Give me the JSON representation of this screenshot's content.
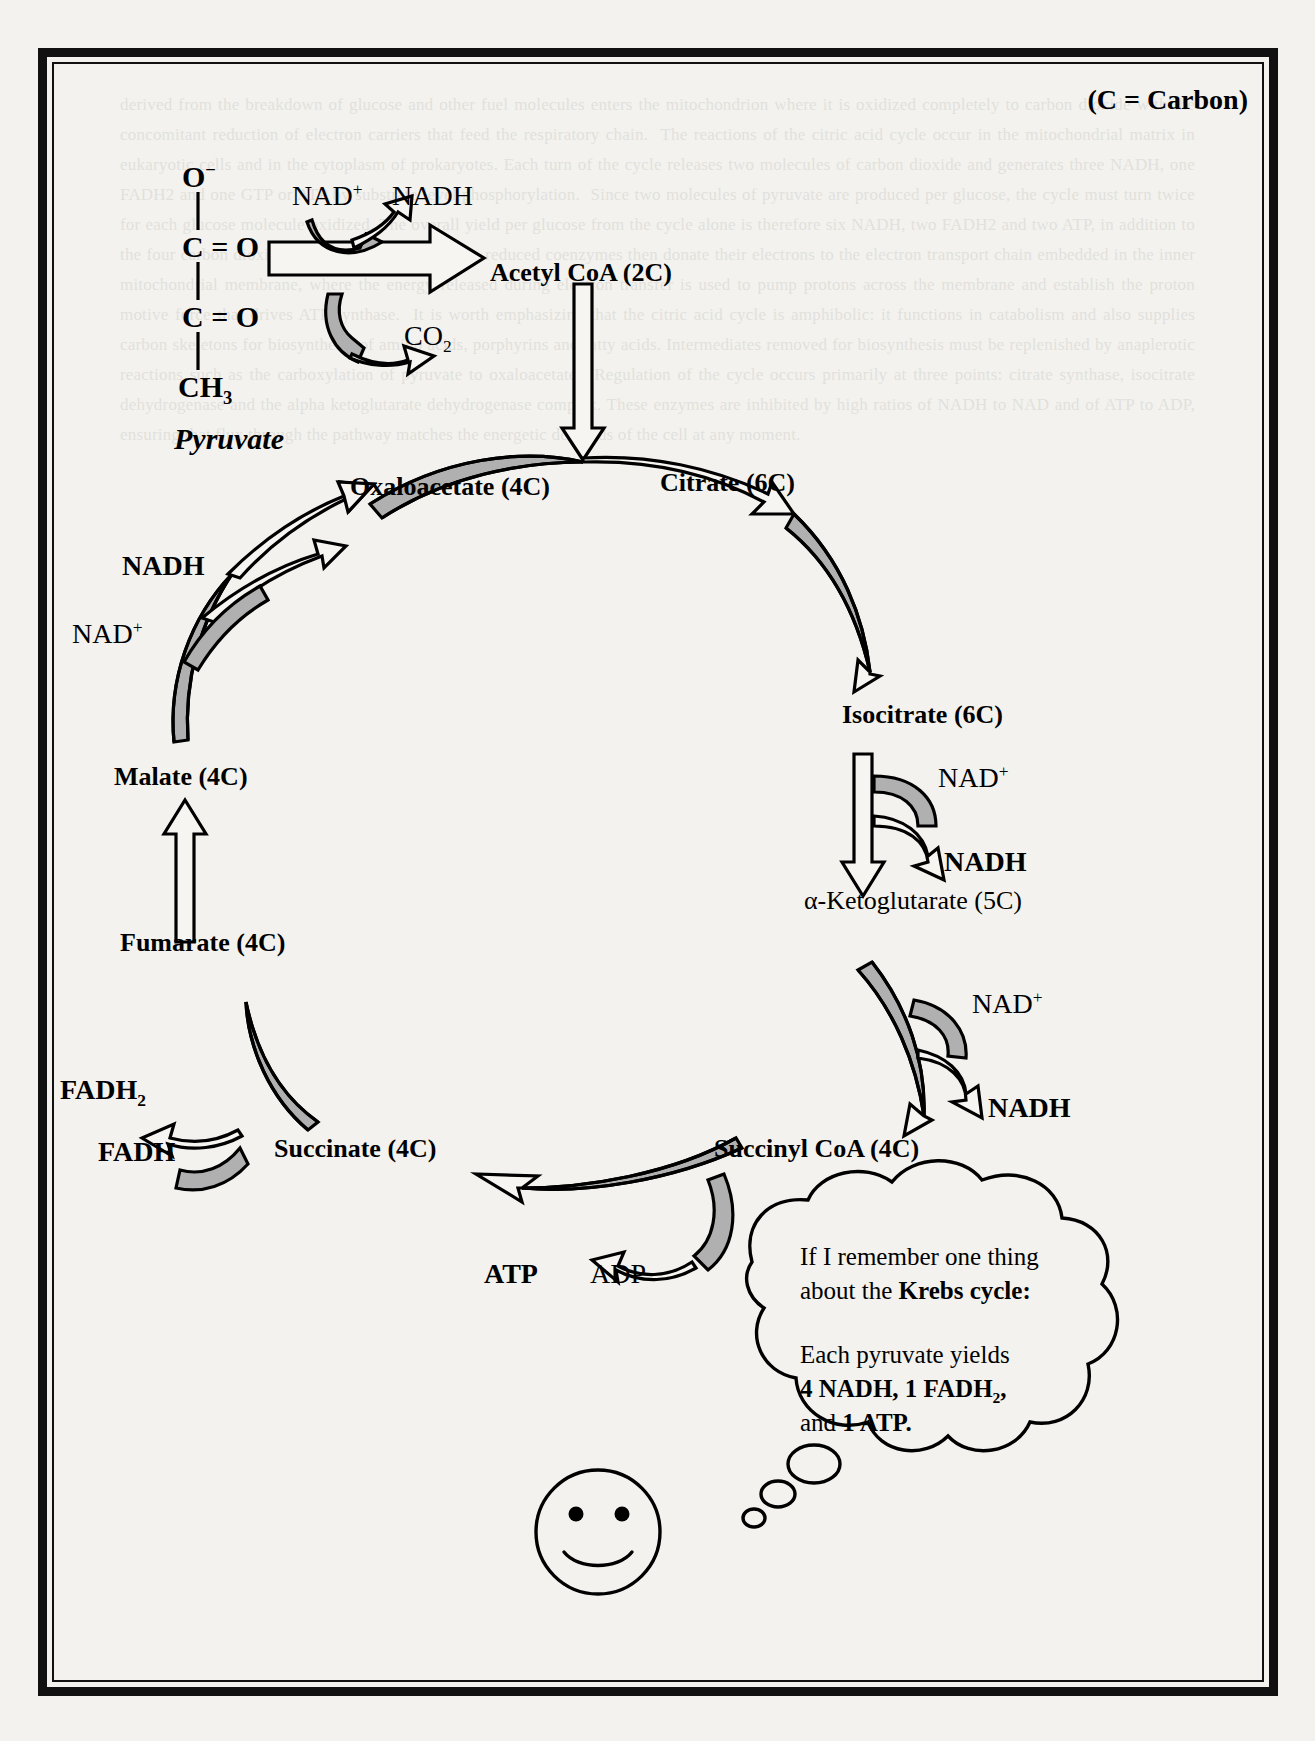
{
  "figure": {
    "legend": "(C = Carbon)",
    "pyruvate_label": "Pyruvate",
    "structure": {
      "atoms": [
        "O−",
        "C = O",
        "C = O",
        "CH₃"
      ],
      "o_minus": "O",
      "o_charge": "−",
      "c_double_o": "C = O",
      "ch3_base": "CH",
      "ch3_sub": "3"
    }
  },
  "decarboxylation": {
    "nad_plus_base": "NAD",
    "nad_plus_sup": "+",
    "nadh": "NADH",
    "co2_base": "CO",
    "co2_sub": "2",
    "product": "Acetyl CoA (2C)"
  },
  "cycle": {
    "intermediates": [
      {
        "name": "Oxaloacetate (4C)"
      },
      {
        "name": "Citrate (6C)"
      },
      {
        "name": "Isocitrate (6C)"
      },
      {
        "name": "α-Ketoglutarate (5C)"
      },
      {
        "name": "Succinyl CoA (4C)"
      },
      {
        "name": "Succinate (4C)"
      },
      {
        "name": "Fumarate (4C)"
      },
      {
        "name": "Malate (4C)"
      }
    ]
  },
  "cofactors": {
    "nadh": "NADH",
    "nad_plus_base": "NAD",
    "nad_plus_sup": "+",
    "fadh2_base": "FADH",
    "fadh2_sub": "2",
    "fadh": "FADH",
    "atp": "ATP",
    "adp": "ADP"
  },
  "thought_bubble": {
    "line1": "If I remember one thing",
    "line2_prefix": "about the ",
    "line2_bold": "Krebs cycle:",
    "line3": "Each pyruvate yields",
    "line4_bold": "4 NADH, 1 FADH",
    "line4_sub": "2",
    "line4_tail": ",",
    "line5_prefix": "and ",
    "line5_bold": "1 ATP."
  },
  "colors": {
    "ink": "#000000",
    "paper": "#f3f2ee",
    "arrow_fill_shade": "#b0b0b0",
    "arrow_fill_white": "#f6f5f1"
  },
  "ghost_text": "derived from the breakdown of glucose and other fuel molecules enters the mitochondrion where it is oxidized completely to carbon dioxide with the concomitant reduction of electron carriers that feed the respiratory chain.  The reactions of the citric acid cycle occur in the mitochondrial matrix in eukaryotic cells and in the cytoplasm of prokaryotes. Each turn of the cycle releases two molecules of carbon dioxide and generates three NADH, one FADH2 and one GTP or ATP by substrate level phosphorylation.  Since two molecules of pyruvate are produced per glucose, the cycle must turn twice for each glucose molecule oxidized. The overall yield per glucose from the cycle alone is therefore six NADH, two FADH2 and two ATP, in addition to the four carbon dioxide molecules released.  These reduced coenzymes then donate their electrons to the electron transport chain embedded in the inner mitochondrial membrane, where the energy released during electron transfer is used to pump protons across the membrane and establish the proton motive force that drives ATP synthase.  It is worth emphasizing that the citric acid cycle is amphibolic: it functions in catabolism and also supplies carbon skeletons for biosynthesis of amino acids, porphyrins and fatty acids. Intermediates removed for biosynthesis must be replenished by anaplerotic reactions such as the carboxylation of pyruvate to oxaloacetate.  Regulation of the cycle occurs primarily at three points: citrate synthase, isocitrate dehydrogenase and the alpha ketoglutarate dehydrogenase complex. These enzymes are inhibited by high ratios of NADH to NAD and of ATP to ADP, ensuring that flux through the pathway matches the energetic demands of the cell at any moment."
}
